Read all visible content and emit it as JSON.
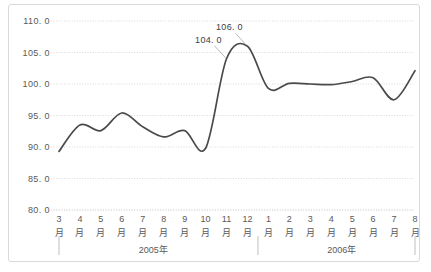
{
  "chart_data": {
    "type": "line",
    "title": "",
    "xlabel": "",
    "ylabel": "",
    "ylim": [
      80.0,
      110.0
    ],
    "ytick_step": 5.0,
    "yticks": [
      "110. 0",
      "105. 0",
      "100. 0",
      "95. 0",
      "90. 0",
      "85. 0",
      "80. 0"
    ],
    "ytick_values": [
      110.0,
      105.0,
      100.0,
      95.0,
      90.0,
      85.0,
      80.0
    ],
    "grid": true,
    "legend": "none",
    "line_color": "#4a4a4a",
    "grid_color": "#d0d0d0",
    "border_color": "#d9d9d9",
    "month_suffix": "月",
    "categories": [
      "3",
      "4",
      "5",
      "6",
      "7",
      "8",
      "9",
      "10",
      "11",
      "12",
      "1",
      "2",
      "3",
      "4",
      "5",
      "6",
      "7",
      "8"
    ],
    "values": [
      89.3,
      93.5,
      92.6,
      95.4,
      93.2,
      91.6,
      92.6,
      89.8,
      104.0,
      106.0,
      99.3,
      100.1,
      100.0,
      99.9,
      100.4,
      101.0,
      97.5,
      102.1
    ],
    "annotations": [
      {
        "label": "104. 0",
        "index": 8,
        "value": 104.0
      },
      {
        "label": "106. 0",
        "index": 9,
        "value": 106.0
      }
    ],
    "groups": [
      {
        "label": "2005年",
        "start": 0,
        "end": 9
      },
      {
        "label": "2006年",
        "start": 10,
        "end": 17
      }
    ]
  }
}
